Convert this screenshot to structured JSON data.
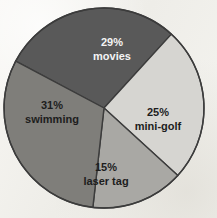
{
  "chart_data": {
    "type": "pie",
    "title": "",
    "subtitle": "",
    "xlabel": "",
    "ylabel": "",
    "grid": false,
    "legend": "none",
    "labels_inside_slices": true,
    "total_percent": 100,
    "categories": [
      "movies",
      "mini-golf",
      "laser tag",
      "swimming"
    ],
    "values": [
      29,
      25,
      15,
      31
    ],
    "slices": [
      {
        "name": "movies",
        "percent": 29,
        "percent_label": "29%",
        "name_label": "movies",
        "color": "#595959",
        "text_color": "#f4f4f4",
        "start_angle_deg": -62,
        "end_angle_deg": 42.4
      },
      {
        "name": "mini-golf",
        "percent": 25,
        "percent_label": "25%",
        "name_label": "mini-golf",
        "color": "#d6d5d1",
        "text_color": "#1d1d1d",
        "start_angle_deg": 42.4,
        "end_angle_deg": 132.4
      },
      {
        "name": "laser tag",
        "percent": 15,
        "percent_label": "15%",
        "name_label": "laser tag",
        "color": "#a9a8a4",
        "text_color": "#1d1d1d",
        "start_angle_deg": 132.4,
        "end_angle_deg": 186.4
      },
      {
        "name": "swimming",
        "percent": 31,
        "percent_label": "31%",
        "name_label": "swimming",
        "color": "#7f7e7a",
        "text_color": "#1d1d1d",
        "start_angle_deg": 186.4,
        "end_angle_deg": 298
      }
    ],
    "geometry": {
      "center_x": 104,
      "center_y": 108,
      "radius": 100,
      "outline_color": "#3c3c3c",
      "outline_width": 1.4,
      "background_color": "#f3f2ee"
    },
    "label_positions": [
      {
        "slice": "movies",
        "pct_x": 112,
        "pct_y": 43,
        "name_x": 112,
        "name_y": 57
      },
      {
        "slice": "mini-golf",
        "pct_x": 158,
        "pct_y": 113,
        "name_x": 158,
        "name_y": 127
      },
      {
        "slice": "laser tag",
        "pct_x": 106,
        "pct_y": 168,
        "name_x": 106,
        "name_y": 182
      },
      {
        "slice": "swimming",
        "pct_x": 52,
        "pct_y": 106,
        "name_x": 52,
        "name_y": 120
      }
    ]
  }
}
